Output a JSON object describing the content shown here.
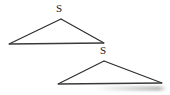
{
  "canvas": {
    "width": 170,
    "height": 95,
    "background_color": "#ffffff",
    "description": "Two outlined triangles drawn on a white background, each with a letter S labelling its top vertex"
  },
  "style": {
    "stroke_color": "#2b2b2b",
    "base_stroke_color": "#3a3a3a",
    "label_color": "#1c1c1c",
    "stroke_width": 1.1,
    "base_stroke_width": 1.6,
    "label_font_size_px": 11
  },
  "figure": {
    "shapes": [
      {
        "id": "upper-triangle",
        "name": "upper-triangle",
        "type": "triangle",
        "vertices": {
          "apex": {
            "x": 61,
            "y": 19
          },
          "left": {
            "x": 9,
            "y": 44
          },
          "right": {
            "x": 104,
            "y": 43
          }
        },
        "points": "61,19 9,44 104,43",
        "label": {
          "text": "S",
          "at_vertex": "apex",
          "x": 56,
          "y": 3
        }
      },
      {
        "id": "lower-triangle",
        "name": "lower-triangle",
        "type": "triangle",
        "vertices": {
          "apex": {
            "x": 104,
            "y": 61
          },
          "left": {
            "x": 58,
            "y": 84
          },
          "right": {
            "x": 162,
            "y": 83
          }
        },
        "points": "104,61 58,84 162,83",
        "label": {
          "text": "S",
          "at_vertex": "apex",
          "x": 100,
          "y": 45
        }
      }
    ]
  },
  "labels": {
    "upper_s": "S",
    "lower_s": "S"
  },
  "paths": {
    "upper_left_edge": "M 61 19 L 9 44",
    "upper_right_edge": "M 61 19 L 104 43",
    "upper_base_edge": "M 9 44 L 104 43",
    "lower_left_edge": "M 104 61 L 58 84",
    "lower_right_edge": "M 104 61 L 162 83",
    "lower_base_edge": "M 58 84 L 162 83"
  }
}
